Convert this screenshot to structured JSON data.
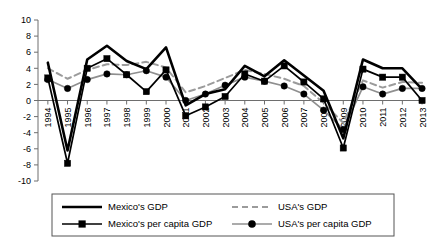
{
  "chart_data": {
    "type": "line",
    "title": "",
    "subtitle": "",
    "xlabel": "",
    "ylabel": "",
    "ylim": [
      -10,
      10
    ],
    "ytick_step": 2,
    "yticks": [
      10,
      8,
      6,
      4,
      2,
      0,
      -2,
      -4,
      -6,
      -8,
      -10
    ],
    "grid": false,
    "legend_position": "bottom",
    "categories": [
      "1994",
      "1995",
      "1996",
      "1997",
      "1998",
      "1999",
      "2000",
      "2001",
      "2002",
      "2003",
      "2004",
      "2005",
      "2006",
      "2007",
      "2008",
      "2009",
      "2010",
      "2011",
      "2012",
      "2013"
    ],
    "series": [
      {
        "name": "Mexico's GDP",
        "style": "solid-thick-black",
        "color": "#000000",
        "marker": "none",
        "values": [
          4.7,
          -6.2,
          5.1,
          6.8,
          4.9,
          3.9,
          6.6,
          -0.6,
          0.8,
          1.4,
          4.3,
          3.0,
          5.0,
          3.1,
          1.2,
          -4.7,
          5.1,
          4.0,
          4.0,
          1.4
        ]
      },
      {
        "name": "Mexico's per capita GDP",
        "style": "solid-thin-black-square",
        "color": "#000000",
        "marker": "square",
        "values": [
          2.8,
          -7.8,
          4.0,
          5.2,
          3.2,
          1.1,
          3.8,
          -1.9,
          -0.8,
          0.5,
          3.3,
          2.4,
          4.3,
          2.3,
          0.2,
          -5.9,
          3.9,
          2.9,
          2.9,
          0.0
        ]
      },
      {
        "name": "USA's GDP",
        "style": "dashed-gray",
        "color": "#9b9b9b",
        "marker": "none",
        "values": [
          4.0,
          2.7,
          3.8,
          4.5,
          4.4,
          4.8,
          4.1,
          1.0,
          1.8,
          2.8,
          3.8,
          3.3,
          2.7,
          1.8,
          -0.3,
          -2.8,
          2.5,
          1.6,
          2.3,
          2.2
        ]
      },
      {
        "name": "USA's per capita GDP",
        "style": "solid-gray-circle",
        "color": "#8f8f8f",
        "marker": "circle",
        "values": [
          2.6,
          1.5,
          2.6,
          3.3,
          3.2,
          3.7,
          2.9,
          0.0,
          0.8,
          1.9,
          2.9,
          2.4,
          1.8,
          0.8,
          -1.2,
          -3.6,
          1.7,
          0.8,
          1.5,
          1.5
        ]
      }
    ]
  },
  "legend": {
    "entries": [
      {
        "label": "Mexico's GDP",
        "series": 0
      },
      {
        "label": "USA's GDP",
        "series": 2
      },
      {
        "label": "Mexico's per capita GDP",
        "series": 1
      },
      {
        "label": "USA's per capita GDP",
        "series": 3
      }
    ]
  },
  "colors": {
    "mexico": "#000000",
    "usa": "#9b9b9b",
    "axis": "#6e6e6e",
    "background": "#ffffff"
  }
}
